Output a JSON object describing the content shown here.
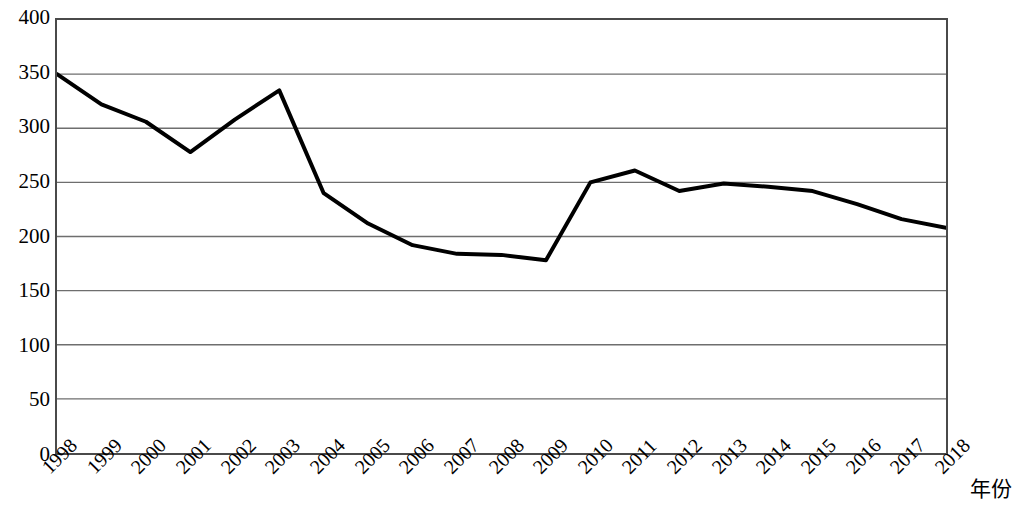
{
  "chart_data": {
    "type": "line",
    "title": "",
    "subtitle": "",
    "xlabel": "年份",
    "ylabel": "",
    "grid": true,
    "legend": null,
    "legend_position": "none",
    "xlim": [
      1998,
      2018
    ],
    "ylim": [
      0,
      400
    ],
    "y_ticks": [
      400,
      350,
      300,
      250,
      200,
      150,
      100,
      50,
      0
    ],
    "x_ticks": [
      "1998",
      "1999",
      "2000",
      "2001",
      "2002",
      "2003",
      "2004",
      "2005",
      "2006",
      "2007",
      "2008",
      "2009",
      "2010",
      "2011",
      "2012",
      "2013",
      "2014",
      "2015",
      "2016",
      "2017",
      "2018"
    ],
    "categories": [
      1998,
      1999,
      2000,
      2001,
      2002,
      2003,
      2004,
      2005,
      2006,
      2007,
      2008,
      2009,
      2010,
      2011,
      2012,
      2013,
      2014,
      2015,
      2016,
      2017,
      2018
    ],
    "values": [
      350,
      322,
      306,
      278,
      308,
      335,
      240,
      212,
      192,
      184,
      183,
      178,
      250,
      261,
      242,
      249,
      246,
      242,
      230,
      216,
      208
    ],
    "series": [
      {
        "name": "",
        "color": "#000000",
        "line_width": 4,
        "values": [
          350,
          322,
          306,
          278,
          308,
          335,
          240,
          212,
          192,
          184,
          183,
          178,
          250,
          261,
          242,
          249,
          246,
          242,
          230,
          216,
          208
        ]
      }
    ],
    "colors": {
      "line": "#000000",
      "grid": "#6e6e6e",
      "axis": "#4a4a4a",
      "background": "#ffffff",
      "text": "#000000"
    }
  }
}
